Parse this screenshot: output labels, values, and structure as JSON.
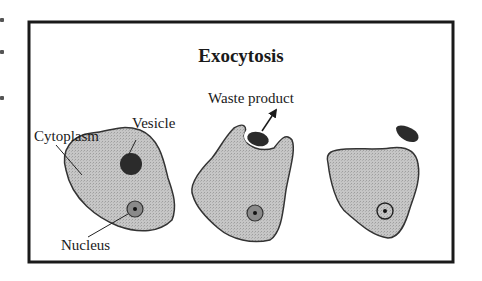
{
  "diagram": {
    "title": "Exocytosis",
    "labels": {
      "cytoplasm": "Cytoplasm",
      "vesicle": "Vesicle",
      "nucleus": "Nucleus",
      "waste_product": "Waste product"
    },
    "stages": [
      {
        "name": "cell-with-vesicle"
      },
      {
        "name": "vesicle-fusing-with-membrane"
      },
      {
        "name": "waste-released"
      }
    ],
    "colors": {
      "frame": "#1a1a1a",
      "cell_fill": "#c4c4c4",
      "cell_stroke": "#333333",
      "vesicle": "#2b2b2b",
      "nucleus_fill": "#8a8a8a"
    }
  }
}
